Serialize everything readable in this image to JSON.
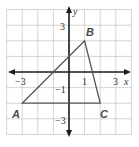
{
  "diagram": {
    "type": "coordinate-plane-triangle",
    "axes": {
      "x_label": "x",
      "y_label": "y",
      "x_range": [
        -4,
        4
      ],
      "y_range": [
        -4,
        4
      ]
    },
    "tick_labels": {
      "x": [
        {
          "value": -3,
          "text": "−3"
        },
        {
          "value": 1,
          "text": "1"
        },
        {
          "value": 3,
          "text": "3"
        }
      ],
      "y": [
        {
          "value": 3,
          "text": "3"
        },
        {
          "value": -1,
          "text": "−1"
        },
        {
          "value": -3,
          "text": "−3"
        }
      ]
    },
    "vertices": [
      {
        "name": "A",
        "x": -3,
        "y": -2
      },
      {
        "name": "B",
        "x": 1,
        "y": 2
      },
      {
        "name": "C",
        "x": 2,
        "y": -2
      }
    ],
    "labels": {
      "A": "A",
      "B": "B",
      "C": "C",
      "x_axis": "x",
      "y_axis": "y",
      "tick_x_neg3": "−3",
      "tick_x_1": "1",
      "tick_x_3": "3",
      "tick_y_3": "3",
      "tick_y_neg1": "−1",
      "tick_y_neg3": "−3"
    },
    "colors": {
      "grid": "#c9c9c9",
      "axis": "#1a1a1a",
      "triangle": "#555555"
    }
  }
}
